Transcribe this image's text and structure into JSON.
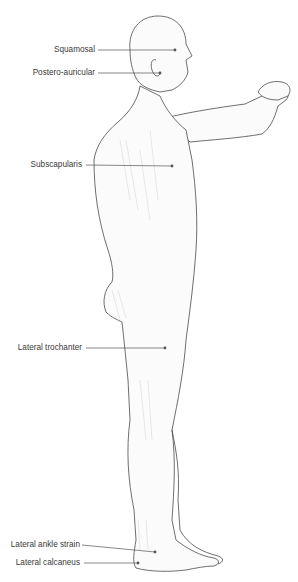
{
  "figure": {
    "line_color": "#555555",
    "outline_color": "#4a4a4a",
    "shade_color": "#d8d8d8"
  },
  "labels": [
    {
      "id": "squamosal",
      "text": "Squamosal",
      "text_right": 95,
      "y": 50,
      "line_x1": 98,
      "dot_x": 175,
      "dot_y": 50
    },
    {
      "id": "postero-auricular",
      "text": "Postero-auricular",
      "text_right": 95,
      "y": 73,
      "line_x1": 98,
      "dot_x": 160,
      "dot_y": 73
    },
    {
      "id": "subscapularis",
      "text": "Subscapularis",
      "text_right": 82,
      "y": 165,
      "line_x1": 86,
      "dot_x": 172,
      "dot_y": 166
    },
    {
      "id": "lateral-trochanter",
      "text": "Lateral trochanter",
      "text_right": 82,
      "y": 348,
      "line_x1": 86,
      "dot_x": 165,
      "dot_y": 348
    },
    {
      "id": "lateral-ankle-strain",
      "text": "Lateral ankle strain",
      "text_right": 80,
      "y": 545,
      "line_x1": 82,
      "dot_x": 155,
      "dot_y": 552
    },
    {
      "id": "lateral-calcaneus",
      "text": "Lateral calcaneus",
      "text_right": 80,
      "y": 563,
      "line_x1": 84,
      "dot_x": 138,
      "dot_y": 563
    }
  ]
}
